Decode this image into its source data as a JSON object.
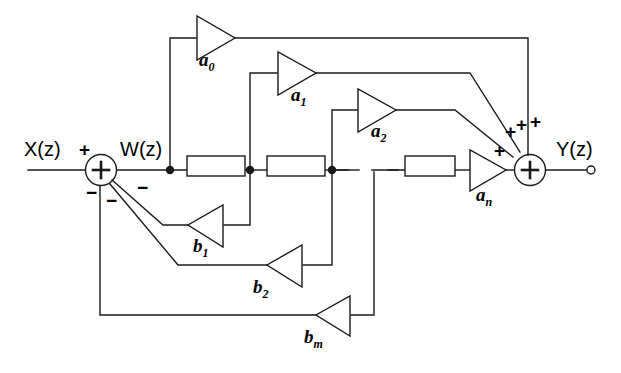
{
  "diagram": {
    "stroke_color": "#1a1a1a",
    "fill_color": "#ffffff",
    "text_color": "#000000"
  },
  "signals": {
    "input": "X(z)",
    "intermediate": "W(z)",
    "output": "Y(z)"
  },
  "signs": {
    "input_plus": "+",
    "fb1_minus": "−",
    "fb2_minus": "−",
    "fb3_minus": "−",
    "an_plus": "+",
    "a2_plus": "+",
    "a1_plus": "+",
    "a0_plus": "+"
  },
  "feedforward_coefficients": [
    {
      "name": "a0",
      "base": "a",
      "sub": "0"
    },
    {
      "name": "a1",
      "base": "a",
      "sub": "1"
    },
    {
      "name": "a2",
      "base": "a",
      "sub": "2"
    },
    {
      "name": "an",
      "base": "a",
      "sub": "n"
    }
  ],
  "feedback_coefficients": [
    {
      "name": "b1",
      "base": "b",
      "sub": "1"
    },
    {
      "name": "b2",
      "base": "b",
      "sub": "2"
    },
    {
      "name": "bm",
      "base": "b",
      "sub": "m"
    }
  ],
  "delay_blocks": [
    {
      "name": "delay-1"
    },
    {
      "name": "delay-2"
    },
    {
      "name": "delay-3"
    },
    {
      "name": "delay-n"
    }
  ],
  "adders": [
    {
      "name": "input-summing-junction",
      "glyph": "+"
    },
    {
      "name": "output-summing-junction",
      "glyph": "+"
    }
  ],
  "ellipsis": {
    "name": "delay-chain-ellipsis"
  }
}
